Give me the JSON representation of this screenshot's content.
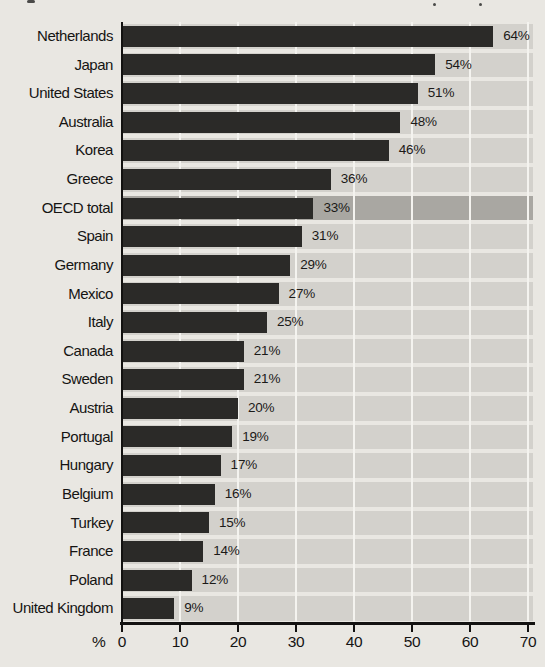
{
  "chart_data": {
    "type": "bar",
    "orientation": "horizontal",
    "unit": "%",
    "categories": [
      "Netherlands",
      "Japan",
      "United States",
      "Australia",
      "Korea",
      "Greece",
      "OECD total",
      "Spain",
      "Germany",
      "Mexico",
      "Italy",
      "Canada",
      "Sweden",
      "Austria",
      "Portugal",
      "Hungary",
      "Belgium",
      "Turkey",
      "France",
      "Poland",
      "United Kingdom"
    ],
    "values": [
      64,
      54,
      51,
      48,
      46,
      36,
      33,
      31,
      29,
      27,
      25,
      21,
      21,
      20,
      19,
      17,
      16,
      15,
      14,
      12,
      9
    ],
    "data_labels": [
      "64%",
      "54%",
      "51%",
      "48%",
      "46%",
      "36%",
      "33%",
      "31%",
      "29%",
      "27%",
      "25%",
      "21%",
      "21%",
      "20%",
      "19%",
      "17%",
      "16%",
      "15%",
      "14%",
      "12%",
      "9%"
    ],
    "highlighted_category": "OECD total",
    "xlabel": "%",
    "xlim": [
      0,
      70
    ],
    "x_ticks": [
      0,
      10,
      20,
      30,
      40,
      50,
      60,
      70
    ],
    "grid": true,
    "legend": "none",
    "colors": {
      "bar": "#2b2a28",
      "row_band": "#d3d1cc",
      "highlight_band": "#a9a7a2",
      "gridline": "#f4f3ef",
      "axis": "#131211",
      "page_background": "#e9e7e2"
    }
  },
  "axis": {
    "percent_label": "%",
    "tick_labels": [
      "0",
      "10",
      "20",
      "30",
      "40",
      "50",
      "60",
      "70"
    ]
  }
}
